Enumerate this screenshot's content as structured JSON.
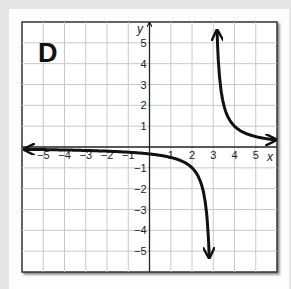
{
  "panel": {
    "label": "D"
  },
  "chart_data": {
    "type": "line",
    "title": "",
    "function": "y = 1/(x - 3)",
    "xlabel": "x",
    "ylabel": "y",
    "xlim": [
      -6,
      6
    ],
    "ylim": [
      -6,
      6
    ],
    "grid": true,
    "x_ticks": [
      -5,
      -4,
      -3,
      -2,
      -1,
      1,
      2,
      3,
      4,
      5
    ],
    "y_ticks": [
      5,
      4,
      3,
      2,
      1,
      -1,
      -2,
      -3,
      -4,
      -5
    ],
    "x_tick_labels": [
      "−5",
      "−4",
      "−3",
      "−2",
      "−1",
      "1",
      "2",
      "3",
      "4",
      "5"
    ],
    "y_tick_labels": [
      "5",
      "4",
      "3",
      "2",
      "1",
      "−1",
      "−2",
      "−3",
      "−4",
      "−5"
    ],
    "asymptotes": {
      "vertical": 3,
      "horizontal": 0
    },
    "series": [
      {
        "name": "left branch",
        "x": [
          -6,
          -4,
          -2,
          0,
          1,
          2,
          2.5,
          2.8,
          2.95
        ],
        "y": [
          -0.11,
          -0.14,
          -0.2,
          -0.33,
          -0.5,
          -1,
          -2,
          -5,
          -6
        ]
      },
      {
        "name": "right branch",
        "x": [
          3.17,
          3.2,
          3.5,
          4,
          5,
          6
        ],
        "y": [
          6,
          5,
          2,
          1,
          0.5,
          0.33
        ]
      }
    ]
  }
}
